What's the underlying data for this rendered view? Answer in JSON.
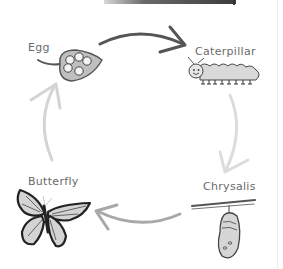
{
  "diagram": {
    "stages": [
      {
        "id": "egg",
        "label": "Egg"
      },
      {
        "id": "caterpillar",
        "label": "Caterpillar"
      },
      {
        "id": "chrysalis",
        "label": "Chrysalis"
      },
      {
        "id": "butterfly",
        "label": "Butterfly"
      }
    ],
    "arrows": [
      {
        "from": "Egg",
        "to": "Caterpillar",
        "color": "#555555"
      },
      {
        "from": "Caterpillar",
        "to": "Chrysalis",
        "color": "#d9d9d9"
      },
      {
        "from": "Chrysalis",
        "to": "Butterfly",
        "color": "#a8a8a8"
      },
      {
        "from": "Butterfly",
        "to": "Egg",
        "color": "#d4d4d4"
      }
    ],
    "colors": {
      "background": "#ffffff",
      "label_text": "#6a6a6a",
      "outline": "#333333",
      "fill_light": "#d6d6d6"
    }
  }
}
